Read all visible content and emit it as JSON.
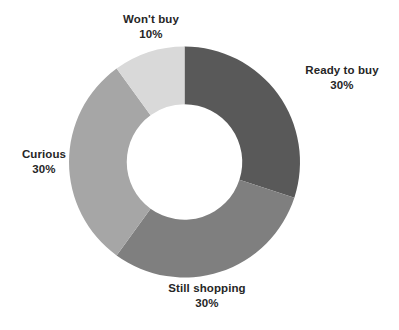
{
  "chart_data": {
    "type": "pie",
    "variant": "donut",
    "title": "",
    "subtitle": "",
    "xlabel": "",
    "ylabel": "",
    "grid": false,
    "legend": "none",
    "labels_position": "outside",
    "start_angle_deg": 0,
    "direction": "clockwise",
    "hole_ratio": 0.5,
    "value_unit": "percent",
    "categories": [
      "Ready to buy",
      "Still shopping",
      "Curious",
      "Won't buy"
    ],
    "values": [
      30,
      30,
      30,
      10
    ],
    "value_labels": [
      "30%",
      "30%",
      "30%",
      "10%"
    ],
    "colors": [
      "#595959",
      "#7f7f7f",
      "#a6a6a6",
      "#d9d9d9"
    ],
    "slices": [
      {
        "name": "Ready to buy",
        "value": 30,
        "value_label": "30%",
        "color": "#595959",
        "start_angle_deg": 0,
        "end_angle_deg": 108
      },
      {
        "name": "Still shopping",
        "value": 30,
        "value_label": "30%",
        "color": "#7f7f7f",
        "start_angle_deg": 108,
        "end_angle_deg": 216
      },
      {
        "name": "Curious",
        "value": 30,
        "value_label": "30%",
        "color": "#a6a6a6",
        "start_angle_deg": 216,
        "end_angle_deg": 324
      },
      {
        "name": "Won't buy",
        "value": 10,
        "value_label": "10%",
        "color": "#d9d9d9",
        "start_angle_deg": 324,
        "end_angle_deg": 360
      }
    ],
    "background_color": "#ffffff",
    "label_text_color": "#262626"
  }
}
